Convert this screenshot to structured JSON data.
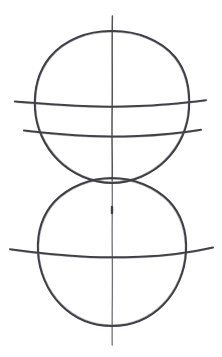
{
  "document": {
    "kind": "hand-drawn sketch",
    "title": "Two tangent circles with vertical axis and horizontal latitude lines",
    "background_color": "#ffffff",
    "ink_color": "#3f3f45",
    "axis_color": "#53535a",
    "width": 222,
    "height": 357,
    "medium": "pencil-on-paper line drawing",
    "text_content": ""
  },
  "drawing": {
    "shapes": [
      {
        "name": "upper-circle",
        "type": "circle",
        "cx": 112,
        "cy": 108,
        "r": 77,
        "stroke": "#3f3f45",
        "stroke_width": 2.1
      },
      {
        "name": "lower-circle",
        "type": "circle",
        "cx": 112,
        "cy": 252,
        "r": 74,
        "stroke": "#3f3f45",
        "stroke_width": 2.1
      }
    ],
    "vertical_axis": {
      "name": "vertical-axis-line",
      "type": "line",
      "x": 112,
      "y_start": 16,
      "y_end": 345,
      "stroke": "#53535a",
      "stroke_width": 1.5
    },
    "latitude_lines": [
      {
        "name": "upper-equator-line",
        "type": "bowed-horizontal",
        "x_start": 15,
        "x_end": 206,
        "y_edge_left": 101,
        "y_center": 106,
        "y_edge_right": 100,
        "stroke": "#3f3f45",
        "stroke_width": 2.0
      },
      {
        "name": "upper-lower-latitude-line",
        "type": "bowed-horizontal",
        "x_start": 24,
        "x_end": 201,
        "y_edge_left": 130,
        "y_center": 136,
        "y_edge_right": 130,
        "stroke": "#3f3f45",
        "stroke_width": 2.0
      },
      {
        "name": "lower-equator-line",
        "type": "bowed-horizontal",
        "x_start": 10,
        "x_end": 213,
        "y_edge_left": 249,
        "y_center": 257,
        "y_edge_right": 247,
        "stroke": "#3f3f45",
        "stroke_width": 2.0
      }
    ],
    "tick_marks": [
      {
        "name": "axis-tick-mark",
        "x": 112,
        "y_start": 207,
        "y_end": 213
      }
    ],
    "tangency": {
      "name": "circle-tangent-point",
      "x": 112,
      "y": 181,
      "note": "upper and lower circles meet near the vertical axis"
    }
  },
  "labels": {
    "caption": "",
    "annotations": []
  }
}
